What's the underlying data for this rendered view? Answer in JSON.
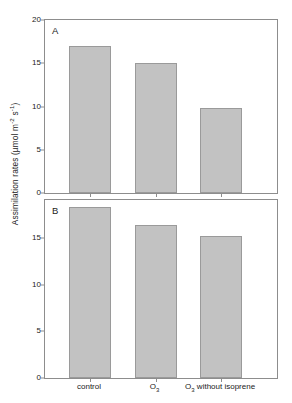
{
  "chart_data": {
    "type": "bar",
    "title": "",
    "ylabel": "Assimilation rates (µmol m⁻² s⁻¹)",
    "ylabel_parts": {
      "text_before": "Assimilation rates (µmol m",
      "sup1": "-2",
      "middle": " s",
      "sup2": "-1",
      "text_after": ")"
    },
    "xlabel": "",
    "grid": false,
    "legend": null,
    "categories": [
      "control",
      "O3",
      "O3 without isoprene"
    ],
    "category_labels": [
      {
        "before": "control",
        "sub": "",
        "after": ""
      },
      {
        "before": "O",
        "sub": "3",
        "after": ""
      },
      {
        "before": "O",
        "sub": "3",
        "after": " without isoprene"
      }
    ],
    "panels": [
      {
        "letter": "A",
        "ylim": [
          0,
          20
        ],
        "yticks": [
          0,
          5,
          10,
          15,
          20
        ],
        "ytick_labels": [
          "0",
          "5",
          "10",
          "15",
          "20"
        ],
        "values": [
          17.0,
          15.0,
          9.8
        ]
      },
      {
        "letter": "B",
        "ylim": [
          0,
          19.05
        ],
        "yticks": [
          0,
          5,
          10,
          15
        ],
        "ytick_labels": [
          "0",
          "5",
          "10",
          "15"
        ],
        "values": [
          18.3,
          16.4,
          15.2
        ]
      }
    ],
    "colors": {
      "bar_fill": "#c2c2c2",
      "bar_edge": "#9a9a9a",
      "axis": "#8d8d8d",
      "text": "#222222"
    }
  }
}
